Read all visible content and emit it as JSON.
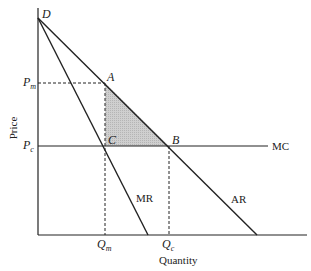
{
  "diagram": {
    "axes": {
      "y_label": "Price",
      "x_label": "Quantity"
    },
    "points": {
      "D": "D",
      "A": "A",
      "B": "B",
      "C": "C"
    },
    "price_ticks": [
      {
        "main": "P",
        "sub": "m"
      },
      {
        "main": "P",
        "sub": "c"
      }
    ],
    "quantity_ticks": [
      {
        "main": "Q",
        "sub": "m"
      },
      {
        "main": "Q",
        "sub": "c"
      }
    ],
    "curves": {
      "mc": "MC",
      "mr": "MR",
      "ar": "AR"
    },
    "colors": {
      "line": "#222222",
      "shade": "#c8c8c8"
    },
    "shaded_region": "deadweight loss triangle ABC"
  }
}
